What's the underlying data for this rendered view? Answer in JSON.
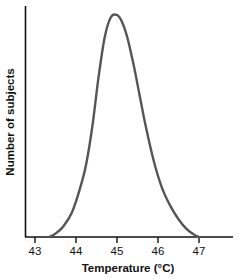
{
  "chart_data": {
    "type": "line",
    "title": "",
    "xlabel": "Temperature (°C)",
    "ylabel": "Number of subjects",
    "xlim": [
      42.75,
      47.8
    ],
    "ylim": [
      0,
      1.06
    ],
    "grid": false,
    "legend": null,
    "xticks": [
      "43",
      "44",
      "45",
      "46",
      "47"
    ],
    "xtick_values": [
      43,
      44,
      45,
      46,
      47
    ],
    "yticks": [],
    "series": [
      {
        "name": "Distribution of subjects by temperature",
        "color": "#555555",
        "line_width": 2.4,
        "x": [
          43.35,
          43.5,
          43.7,
          43.9,
          44.1,
          44.25,
          44.4,
          44.55,
          44.7,
          44.85,
          45.0,
          45.12,
          45.25,
          45.4,
          45.55,
          45.7,
          45.9,
          46.1,
          46.3,
          46.5,
          46.7,
          46.9,
          47.0
        ],
        "y": [
          0.0,
          0.015,
          0.05,
          0.11,
          0.22,
          0.33,
          0.5,
          0.72,
          0.9,
          0.99,
          1.0,
          0.97,
          0.9,
          0.78,
          0.64,
          0.5,
          0.34,
          0.22,
          0.14,
          0.08,
          0.035,
          0.008,
          0.0
        ],
        "peak_x": 45.0,
        "peak_y": 1.0,
        "left_baseline_x": 43.35,
        "right_baseline_x": 47.0,
        "shape": "right-skewed unimodal curve"
      }
    ],
    "colors": {
      "curve": "#555555",
      "axis": "#111111",
      "text": "#111111",
      "background": "#ffffff"
    }
  },
  "axes": {
    "x_title": "Temperature (°C)",
    "y_title": "Number of subjects"
  }
}
